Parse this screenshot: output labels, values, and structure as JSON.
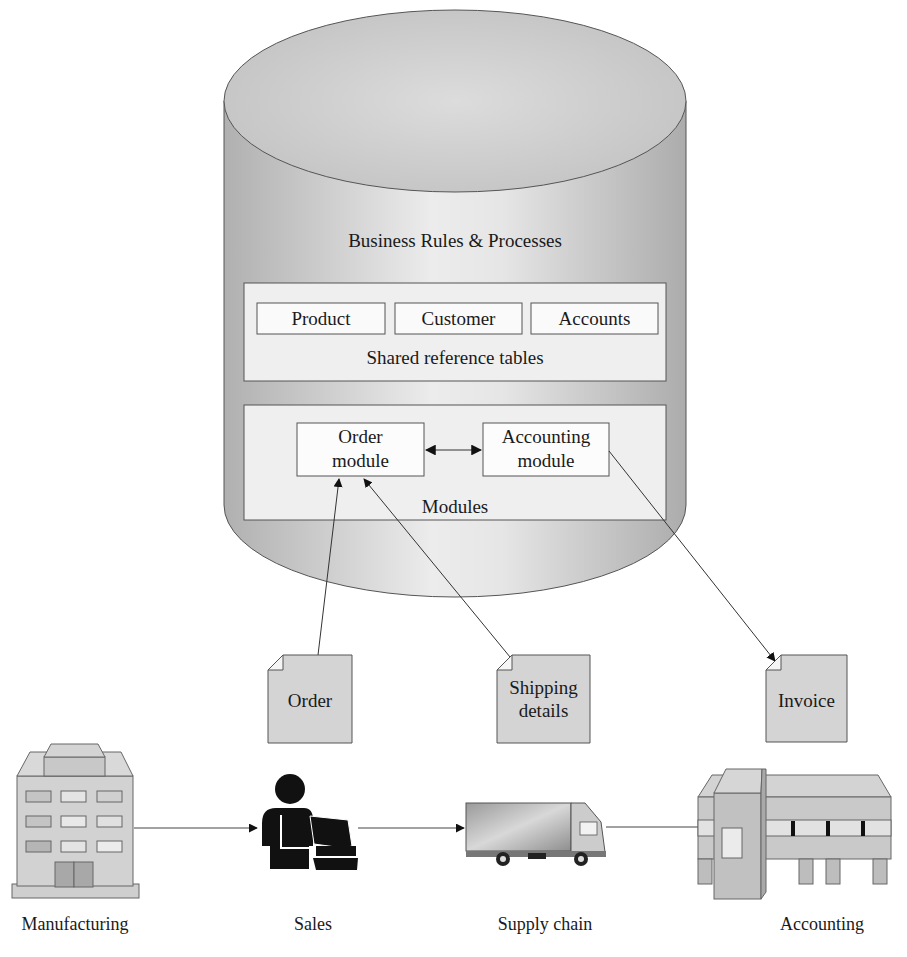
{
  "database": {
    "title": "Business Rules & Processes",
    "shared_tables": {
      "caption": "Shared reference tables",
      "items": [
        "Product",
        "Customer",
        "Accounts"
      ]
    },
    "modules": {
      "caption": "Modules",
      "order_module": {
        "line1": "Order",
        "line2": "module"
      },
      "accounting_module": {
        "line1": "Accounting",
        "line2": "module"
      }
    }
  },
  "documents": [
    {
      "line1": "Order",
      "line2": ""
    },
    {
      "line1": "Shipping",
      "line2": "details"
    },
    {
      "line1": "Invoice",
      "line2": ""
    }
  ],
  "departments": [
    {
      "label": "Manufacturing",
      "icon": "factory-building-icon"
    },
    {
      "label": "Sales",
      "icon": "salesperson-computer-icon"
    },
    {
      "label": "Supply chain",
      "icon": "delivery-truck-icon"
    },
    {
      "label": "Accounting",
      "icon": "warehouse-icon"
    }
  ],
  "colors": {
    "cylinder_edge": "#b3b3b3",
    "cylinder_center": "#ececec",
    "panel_fill": "#efefef",
    "doc_fill": "#d4d4d4",
    "stroke": "#333333"
  }
}
